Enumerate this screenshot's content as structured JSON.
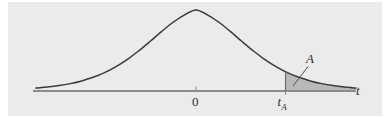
{
  "figure": {
    "kind": "statistical-density-curve",
    "background_color": "#ebebeb",
    "page_color": "#ffffff",
    "curve_color": "#3a3a3a",
    "axis_color": "#8c8c8c",
    "shade_fill_color": "#b9b9b9",
    "shade_stroke_color": "#6e6e6e",
    "leader_line_color": "#555555"
  },
  "labels": {
    "origin": "0",
    "critical_value": "t",
    "critical_value_subscript": "A",
    "axis": "t",
    "area": "A"
  },
  "chart_data": {
    "type": "line",
    "title": "",
    "subtitle": "",
    "xlabel": "t",
    "ylabel": "",
    "grid": false,
    "legend_position": "none",
    "xlim": [
      -4.2,
      4.2
    ],
    "ylim": [
      0,
      1.06
    ],
    "tick_labels_x": [
      "0",
      "tA"
    ],
    "tick_values_x": [
      0,
      2.35
    ],
    "annotations": [
      {
        "text": "A",
        "points_to": "shaded right-tail region",
        "x": 2.95,
        "y": 0.28
      },
      {
        "text": "t",
        "role": "axis name",
        "x": 4.1,
        "y": 0.02
      }
    ],
    "shaded_region": {
      "label": "A",
      "from_x": 2.35,
      "to_x": 4.2,
      "description": "right tail area under the density curve beyond t sub A"
    },
    "x": [
      -4.2,
      -3.9,
      -3.6,
      -3.3,
      -3.0,
      -2.7,
      -2.4,
      -2.1,
      -1.8,
      -1.5,
      -1.2,
      -0.9,
      -0.6,
      -0.3,
      0.0,
      0.3,
      0.6,
      0.9,
      1.2,
      1.5,
      1.8,
      2.1,
      2.4,
      2.7,
      3.0,
      3.3,
      3.6,
      3.9,
      4.2
    ],
    "series": [
      {
        "name": "t density",
        "values": [
          0.032,
          0.044,
          0.06,
          0.082,
          0.112,
          0.152,
          0.204,
          0.271,
          0.352,
          0.447,
          0.552,
          0.661,
          0.763,
          0.845,
          0.9,
          0.845,
          0.763,
          0.661,
          0.552,
          0.447,
          0.352,
          0.271,
          0.204,
          0.152,
          0.112,
          0.082,
          0.06,
          0.044,
          0.032
        ]
      }
    ]
  }
}
